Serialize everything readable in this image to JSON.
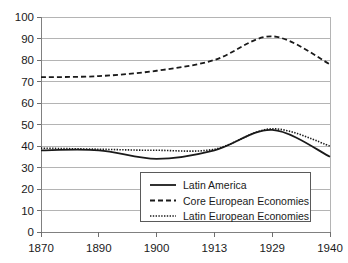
{
  "chart_data": {
    "type": "line",
    "title": "",
    "subtitle": "",
    "xlabel": "",
    "ylabel": "",
    "x": [
      "1870",
      "1890",
      "1900",
      "1913",
      "1929",
      "1940"
    ],
    "categories": [
      "1870",
      "1890",
      "1900",
      "1913",
      "1929",
      "1940"
    ],
    "xtick_labels": [
      "1870",
      "1890",
      "1900",
      "1913",
      "1929",
      "1940"
    ],
    "ytick_labels": [
      "0",
      "10",
      "20",
      "30",
      "40",
      "50",
      "60",
      "70",
      "80",
      "90",
      "100"
    ],
    "ylim": [
      0,
      100
    ],
    "ytick_step": 10,
    "grid": "horizontal",
    "legend_position": "bottom-center-inside",
    "axis_type": "categorical-x",
    "series": [
      {
        "name": "Latin America",
        "style": "solid",
        "color": "#1a1a1a",
        "values": [
          38,
          38,
          34,
          38,
          47.5,
          35
        ]
      },
      {
        "name": "Core European Economies",
        "style": "dashed",
        "color": "#1a1a1a",
        "values": [
          72,
          72.5,
          75,
          80,
          91,
          78
        ]
      },
      {
        "name": "Latin European Economies",
        "style": "dotted",
        "color": "#1a1a1a",
        "values": [
          39,
          38.5,
          38,
          38.5,
          48,
          40
        ]
      }
    ]
  },
  "legend": {
    "entries": [
      {
        "label": "Latin America",
        "style": "solid"
      },
      {
        "label": "Core European Economies",
        "style": "dashed"
      },
      {
        "label": "Latin European Economies",
        "style": "dotted"
      }
    ]
  },
  "colors": {
    "line": "#1a1a1a",
    "grid": "#b4b4b4",
    "axis": "#808080",
    "background": "#ffffff"
  }
}
